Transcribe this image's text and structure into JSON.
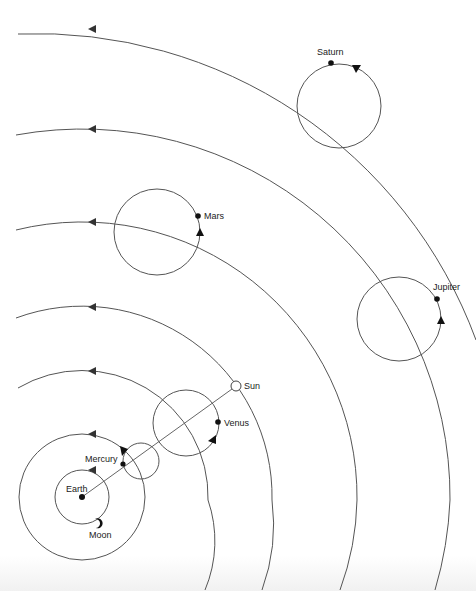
{
  "diagram": {
    "type": "geocentric-planetary-model",
    "colors": {
      "line": "#555555",
      "ink": "#111111",
      "background": "#ffffff"
    },
    "center": {
      "name": "Earth",
      "x": 82,
      "y": 497
    },
    "labels": {
      "earth": "Earth",
      "moon": "Moon",
      "mercury": "Mercury",
      "venus": "Venus",
      "sun": "Sun",
      "mars": "Mars",
      "jupiter": "Jupiter",
      "saturn": "Saturn"
    },
    "deferents": [
      {
        "body": "Moon",
        "radius": 27
      },
      {
        "body": "Mercury",
        "radius": 63
      },
      {
        "body": "Venus",
        "radius": 126
      },
      {
        "body": "Sun",
        "radius": 190
      },
      {
        "body": "Mars",
        "radius": 275
      },
      {
        "body": "Jupiter",
        "radius": 368
      },
      {
        "body": "Saturn",
        "radius": 468
      }
    ],
    "epicycles": [
      {
        "body": "Mercury",
        "cx": 141,
        "cy": 461,
        "r": 18
      },
      {
        "body": "Venus",
        "cx": 186,
        "cy": 423,
        "r": 33
      },
      {
        "body": "Mars",
        "cx": 157,
        "cy": 232,
        "r": 43
      },
      {
        "body": "Jupiter",
        "cx": 399,
        "cy": 319,
        "r": 42
      },
      {
        "body": "Saturn",
        "cx": 339,
        "cy": 106,
        "r": 42
      }
    ],
    "sun_earth_line": {
      "from": [
        82,
        497
      ],
      "to": [
        236,
        386
      ]
    }
  }
}
